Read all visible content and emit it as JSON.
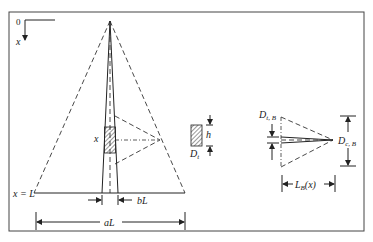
{
  "figure": {
    "axis": {
      "origin_label": "0",
      "x_label": "x"
    },
    "left_view": {
      "x_marker_label": "x",
      "base_label": "x = L",
      "inner_width_label": "bL",
      "outer_width_label": "aL"
    },
    "element_detail": {
      "height_label": "h",
      "diameter_label": "D",
      "diameter_sub": "t"
    },
    "right_view": {
      "inlet_label": "D",
      "inlet_sub": "t, B",
      "outlet_label": "D",
      "outlet_sub": "c, B",
      "length_label": "L",
      "length_sub": "B",
      "length_arg": "(x)"
    }
  }
}
